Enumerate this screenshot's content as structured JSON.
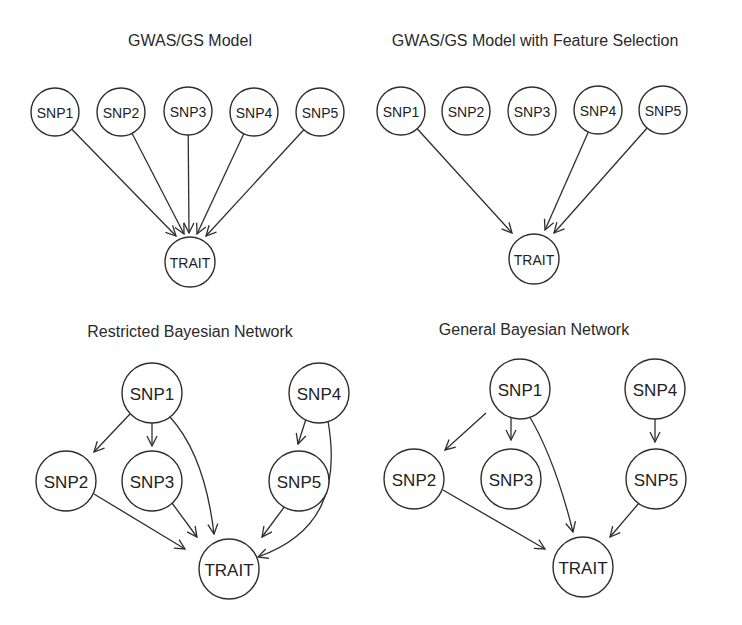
{
  "colors": {
    "stroke": "#2e2e2e",
    "text": "#222222",
    "background": "#ffffff"
  },
  "panels": [
    {
      "id": "gwas-gs-model",
      "title": "GWAS/GS Model",
      "title_pos": [
        190,
        32
      ],
      "radius": 24,
      "font_size": 14,
      "nodes": [
        {
          "id": "SNP1",
          "label": "SNP1",
          "x": 55,
          "y": 112
        },
        {
          "id": "SNP2",
          "label": "SNP2",
          "x": 121,
          "y": 112
        },
        {
          "id": "SNP3",
          "label": "SNP3",
          "x": 188,
          "y": 111
        },
        {
          "id": "SNP4",
          "label": "SNP4",
          "x": 254,
          "y": 112
        },
        {
          "id": "SNP5",
          "label": "SNP5",
          "x": 320,
          "y": 112
        },
        {
          "id": "TRAIT",
          "label": "TRAIT",
          "x": 190,
          "y": 262,
          "r": 25
        }
      ],
      "edges": [
        {
          "from": "SNP1",
          "to": "TRAIT",
          "tx": 176,
          "ty": 236
        },
        {
          "from": "SNP2",
          "to": "TRAIT",
          "tx": 184,
          "ty": 234
        },
        {
          "from": "SNP3",
          "to": "TRAIT",
          "tx": 189,
          "ty": 233
        },
        {
          "from": "SNP4",
          "to": "TRAIT",
          "tx": 197,
          "ty": 234
        },
        {
          "from": "SNP5",
          "to": "TRAIT",
          "tx": 206,
          "ty": 236
        }
      ]
    },
    {
      "id": "gwas-gs-feature-selection",
      "title": "GWAS/GS Model with Feature Selection",
      "title_pos": [
        535,
        32
      ],
      "radius": 24,
      "font_size": 14,
      "nodes": [
        {
          "id": "SNP1",
          "label": "SNP1",
          "x": 401,
          "y": 111
        },
        {
          "id": "SNP2",
          "label": "SNP2",
          "x": 466,
          "y": 111
        },
        {
          "id": "SNP3",
          "label": "SNP3",
          "x": 532,
          "y": 111
        },
        {
          "id": "SNP4",
          "label": "SNP4",
          "x": 598,
          "y": 110
        },
        {
          "id": "SNP5",
          "label": "SNP5",
          "x": 663,
          "y": 110
        },
        {
          "id": "TRAIT",
          "label": "TRAIT",
          "x": 534,
          "y": 259,
          "r": 25
        }
      ],
      "edges": [
        {
          "from": "SNP1",
          "to": "TRAIT",
          "tx": 512,
          "ty": 233
        },
        {
          "from": "SNP4",
          "to": "TRAIT",
          "tx": 545,
          "ty": 230
        },
        {
          "from": "SNP5",
          "to": "TRAIT",
          "tx": 554,
          "ty": 233
        }
      ]
    },
    {
      "id": "restricted-bayesian-network",
      "title": "Restricted Bayesian Network",
      "title_pos": [
        190,
        323
      ],
      "radius": 30,
      "font_size": 17,
      "nodes": [
        {
          "id": "SNP1",
          "label": "SNP1",
          "x": 152,
          "y": 393
        },
        {
          "id": "SNP4",
          "label": "SNP4",
          "x": 319,
          "y": 393
        },
        {
          "id": "SNP2",
          "label": "SNP2",
          "x": 66,
          "y": 481
        },
        {
          "id": "SNP3",
          "label": "SNP3",
          "x": 152,
          "y": 481
        },
        {
          "id": "SNP5",
          "label": "SNP5",
          "x": 299,
          "y": 481
        },
        {
          "id": "TRAIT",
          "label": "TRAIT",
          "x": 229,
          "y": 569
        }
      ],
      "edges": [
        {
          "from": "SNP1",
          "to": "SNP2",
          "path": "M130,414 L94,452"
        },
        {
          "from": "SNP1",
          "to": "SNP3",
          "path": "M152,423 L152,446"
        },
        {
          "from": "SNP1",
          "to": "TRAIT",
          "path": "M170,417 C200,450 210,500 214,534"
        },
        {
          "from": "SNP2",
          "to": "TRAIT",
          "path": "M94,494 L185,549"
        },
        {
          "from": "SNP3",
          "to": "TRAIT",
          "path": "M172,503 L197,537"
        },
        {
          "from": "SNP4",
          "to": "SNP5",
          "path": "M306,419 L298,444"
        },
        {
          "from": "SNP4",
          "to": "TRAIT",
          "path": "M328,421 C340,490 320,535 258,557"
        },
        {
          "from": "SNP5",
          "to": "TRAIT",
          "path": "M285,506 L262,537"
        }
      ]
    },
    {
      "id": "general-bayesian-network",
      "title": "General Bayesian Network",
      "title_pos": [
        534,
        321
      ],
      "radius": 30,
      "font_size": 17,
      "nodes": [
        {
          "id": "SNP1",
          "label": "SNP1",
          "x": 520,
          "y": 389
        },
        {
          "id": "SNP4",
          "label": "SNP4",
          "x": 655,
          "y": 389
        },
        {
          "id": "SNP2",
          "label": "SNP2",
          "x": 414,
          "y": 479
        },
        {
          "id": "SNP3",
          "label": "SNP3",
          "x": 511,
          "y": 479
        },
        {
          "id": "SNP5",
          "label": "SNP5",
          "x": 656,
          "y": 479
        },
        {
          "id": "TRAIT",
          "label": "TRAIT",
          "x": 583,
          "y": 567
        }
      ],
      "edges": [
        {
          "from": "SNP1",
          "to": "SNP2",
          "path": "M486,413 L445,450"
        },
        {
          "from": "SNP1",
          "to": "SNP3",
          "path": "M511,418 L511,440"
        },
        {
          "from": "SNP1",
          "to": "TRAIT",
          "path": "M528,414 C550,450 565,500 573,532"
        },
        {
          "from": "SNP2",
          "to": "TRAIT",
          "path": "M443,490 L545,549"
        },
        {
          "from": "SNP4",
          "to": "SNP5",
          "path": "M655,418 L655,442"
        },
        {
          "from": "SNP5",
          "to": "TRAIT",
          "path": "M639,503 L610,537"
        }
      ]
    }
  ]
}
